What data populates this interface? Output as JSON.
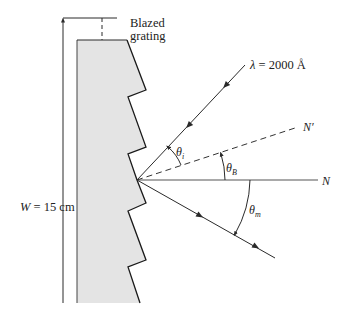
{
  "figure": {
    "type": "blazed-grating-diagram",
    "colors": {
      "line": "#2a2a2a",
      "grating_fill": "#e4e4e4",
      "background": "#ffffff"
    },
    "labels": {
      "grating": [
        "Blazed",
        "grating"
      ],
      "width": "W = 15 cm",
      "wavelength": "λ = 2000 Å",
      "normal_grating": "N",
      "normal_facet": "N′",
      "theta_i": "θ",
      "theta_i_sub": "i",
      "theta_B": "θ",
      "theta_B_sub": "B",
      "theta_m": "θ",
      "theta_m_sub": "m"
    },
    "geometry": {
      "incidence_point": [
        137,
        180
      ],
      "grating_profile": [
        [
          77,
          40
        ],
        [
          127,
          40
        ],
        [
          146,
          90
        ],
        [
          128,
          97
        ],
        [
          146,
          147
        ],
        [
          128,
          154
        ],
        [
          137,
          180
        ],
        [
          146,
          203
        ],
        [
          128,
          211
        ],
        [
          146,
          260
        ],
        [
          128,
          267
        ],
        [
          140,
          303
        ],
        [
          77,
          303
        ]
      ],
      "width_dimension_x": 63,
      "width_dimension_y": [
        18,
        303
      ],
      "incident_ray_end": [
        245,
        65
      ],
      "facet_normal_end": [
        298,
        127
      ],
      "grating_normal_end": [
        320,
        180
      ],
      "diffracted_ray_end": [
        275,
        258
      ]
    }
  }
}
